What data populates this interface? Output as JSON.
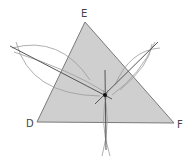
{
  "diagram": {
    "vertices": [
      {
        "label": "E",
        "x": 85,
        "y": 22,
        "lx": 84,
        "ly": 17
      },
      {
        "label": "D",
        "x": 37,
        "y": 122,
        "lx": 29,
        "ly": 127
      },
      {
        "label": "F",
        "x": 174,
        "y": 123,
        "lx": 178,
        "ly": 128
      }
    ],
    "center_point": {
      "x": 105,
      "y": 95
    },
    "colors": {
      "fill": "#cfcfcf",
      "edge": "#7a7a7a",
      "arc": "#9a9a9a",
      "line": "#555555",
      "point": "#111111"
    }
  }
}
